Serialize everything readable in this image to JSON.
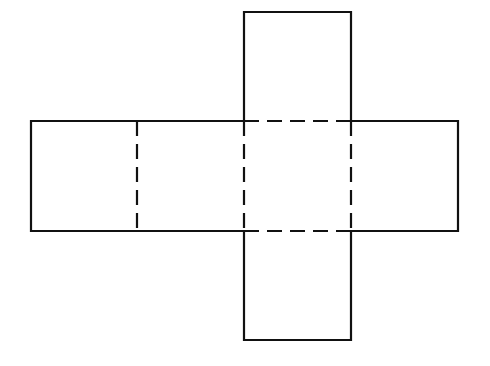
{
  "diagram": {
    "stroke_color": "#111111",
    "background": "#ffffff",
    "faces": [
      {
        "id": "left-face",
        "x": 31,
        "y": 121,
        "w": 106,
        "h": 110
      },
      {
        "id": "center-left-face",
        "x": 137,
        "y": 121,
        "w": 107,
        "h": 110
      },
      {
        "id": "center-face",
        "x": 244,
        "y": 121,
        "w": 107,
        "h": 110
      },
      {
        "id": "right-face",
        "x": 351,
        "y": 121,
        "w": 107,
        "h": 110
      },
      {
        "id": "top-face",
        "x": 244,
        "y": 12,
        "w": 107,
        "h": 109
      },
      {
        "id": "bottom-face",
        "x": 244,
        "y": 231,
        "w": 107,
        "h": 109
      }
    ],
    "fold_lines": "dashed",
    "cut_lines": "solid"
  }
}
